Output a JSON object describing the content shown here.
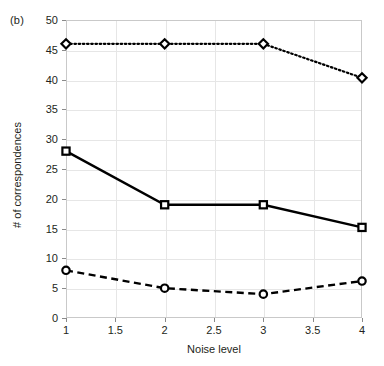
{
  "figure": {
    "panel_label": "(b)",
    "background_color": "#ffffff",
    "frame_color": "#c9c9c9",
    "grid_color": "#e6e6e6",
    "ink_color": "#000000"
  },
  "chart_data": {
    "type": "line",
    "title": "",
    "panel": "(b)",
    "xlabel": "Noise level",
    "ylabel": "# of correspondences",
    "x": [
      1,
      2,
      3,
      4
    ],
    "xlim": [
      1,
      4
    ],
    "ylim": [
      0,
      50
    ],
    "xticks": [
      1,
      1.5,
      2,
      2.5,
      3,
      3.5,
      4
    ],
    "xticklabels": [
      "1",
      "1.5",
      "2",
      "2.5",
      "3",
      "3.5",
      "4"
    ],
    "yticks": [
      0,
      5,
      10,
      15,
      20,
      25,
      30,
      35,
      40,
      45,
      50
    ],
    "yticklabels": [
      "0",
      "5",
      "10",
      "15",
      "20",
      "25",
      "30",
      "35",
      "40",
      "45",
      "50"
    ],
    "grid": true,
    "legend": false,
    "legend_position": "none",
    "series": [
      {
        "name": "dotted-diamond",
        "values": [
          46,
          46,
          46,
          40.3
        ],
        "linestyle": "dotted",
        "marker": "diamond",
        "color": "#000000"
      },
      {
        "name": "solid-square",
        "values": [
          28,
          19,
          19,
          15.2
        ],
        "linestyle": "solid",
        "marker": "square",
        "color": "#000000"
      },
      {
        "name": "dashed-circle",
        "values": [
          8,
          5,
          4,
          6.2
        ],
        "linestyle": "dashed",
        "marker": "circle",
        "color": "#000000"
      }
    ]
  }
}
